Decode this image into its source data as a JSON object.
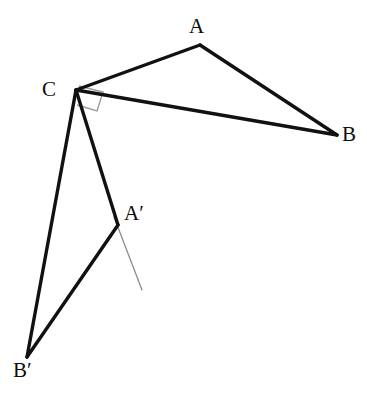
{
  "figure": {
    "background_color": "#ffffff",
    "stroke_color": "#111111",
    "marker_color": "#9a9a9a",
    "axis_ray_color": "#8d8d8d",
    "width": 367,
    "height": 395
  },
  "labels": {
    "a": "A",
    "b": "B",
    "c": "C",
    "a_prime": "A′",
    "b_prime": "B′"
  },
  "chart_data": {
    "type": "diagram",
    "xlabel": "",
    "ylabel": "",
    "xlim": [
      0,
      367
    ],
    "ylim": [
      0,
      395
    ],
    "grid": false,
    "legend": "none",
    "points": [
      {
        "name": "A",
        "label": "A",
        "x": 200,
        "y": 45,
        "label_x": 198,
        "label_y": 30
      },
      {
        "name": "B",
        "label": "B",
        "x": 337,
        "y": 135,
        "label_x": 350,
        "label_y": 138
      },
      {
        "name": "C",
        "label": "C",
        "x": 76,
        "y": 90,
        "label_x": 50,
        "label_y": 93
      },
      {
        "name": "Ap",
        "label": "A′",
        "x": 118,
        "y": 225,
        "label_x": 136,
        "label_y": 217
      },
      {
        "name": "Bp",
        "label": "B′",
        "x": 27,
        "y": 357,
        "label_x": 26,
        "label_y": 374
      }
    ],
    "segments": [
      {
        "name": "CA",
        "from": "C",
        "to": "A",
        "x1": 76,
        "y1": 90,
        "x2": 200,
        "y2": 45,
        "width": 3.4,
        "color": "#111111",
        "style": "solid"
      },
      {
        "name": "AB",
        "from": "A",
        "to": "B",
        "x1": 200,
        "y1": 45,
        "x2": 337,
        "y2": 135,
        "width": 3.4,
        "color": "#111111",
        "style": "solid"
      },
      {
        "name": "CB",
        "from": "C",
        "to": "B",
        "x1": 76,
        "y1": 90,
        "x2": 337,
        "y2": 135,
        "width": 3.4,
        "color": "#111111",
        "style": "solid"
      },
      {
        "name": "CAp",
        "from": "C",
        "to": "Ap",
        "x1": 76,
        "y1": 90,
        "x2": 118,
        "y2": 225,
        "width": 3.4,
        "color": "#111111",
        "style": "solid"
      },
      {
        "name": "ApBp",
        "from": "Ap",
        "to": "Bp",
        "x1": 118,
        "y1": 225,
        "x2": 27,
        "y2": 357,
        "width": 3.4,
        "color": "#111111",
        "style": "solid"
      },
      {
        "name": "CBp",
        "from": "C",
        "to": "Bp",
        "x1": 76,
        "y1": 90,
        "x2": 27,
        "y2": 357,
        "width": 3.4,
        "color": "#111111",
        "style": "solid"
      }
    ],
    "annotations": [
      {
        "name": "right-angle-marker",
        "kind": "right-angle-square",
        "at": "C",
        "color": "#9a9a9a",
        "width": 1.4,
        "path": "M 79 86 L 103 92 L 97 111 L 77 105"
      },
      {
        "name": "rotation-ray",
        "kind": "thin-ray",
        "from": "Ap",
        "color": "#8d8d8d",
        "width": 1.3,
        "x1": 114,
        "y1": 217,
        "x2": 142,
        "y2": 290
      }
    ]
  }
}
